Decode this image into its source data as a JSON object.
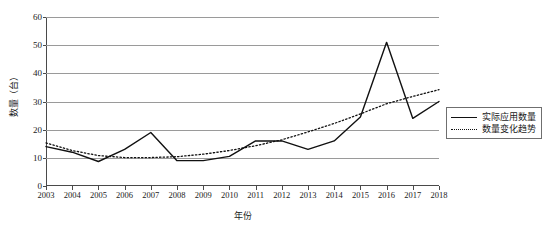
{
  "chart_data": {
    "type": "line",
    "title": "",
    "xlabel": "年份",
    "ylabel": "数量（台）",
    "x": [
      2003,
      2004,
      2005,
      2006,
      2007,
      2008,
      2009,
      2010,
      2011,
      2012,
      2013,
      2014,
      2015,
      2016,
      2017,
      2018
    ],
    "categories": [
      "2003",
      "2004",
      "2005",
      "2006",
      "2007",
      "2008",
      "2009",
      "2010",
      "2011",
      "2012",
      "2013",
      "2014",
      "2015",
      "2016",
      "2017",
      "2018"
    ],
    "xlim": [
      2003,
      2018
    ],
    "ylim": [
      0,
      60
    ],
    "yticks": [
      0,
      10,
      20,
      30,
      40,
      50,
      60
    ],
    "ytick_labels": [
      "0",
      "10",
      "20",
      "30",
      "40",
      "50",
      "60"
    ],
    "grid": true,
    "grid_axis": "y",
    "legend_position": "right-outside",
    "series": [
      {
        "name": "实际应用数量",
        "style": "solid",
        "color": "#111111",
        "values": [
          14,
          12,
          8.7,
          13,
          19,
          9,
          9,
          10.5,
          16,
          16,
          13,
          16,
          24.5,
          51,
          24,
          30
        ]
      },
      {
        "name": "数量变化趋势",
        "style": "dotted",
        "color": "#111111",
        "values": [
          15.3,
          12.6,
          10.8,
          10.1,
          10.1,
          10.4,
          11.3,
          12.6,
          14.3,
          16.4,
          19.2,
          22.2,
          25.6,
          29.2,
          31.8,
          34.2
        ]
      }
    ]
  },
  "legend": {
    "items": [
      {
        "label": "实际应用数量",
        "style": "solid"
      },
      {
        "label": "数量变化趋势",
        "style": "dotted"
      }
    ]
  }
}
